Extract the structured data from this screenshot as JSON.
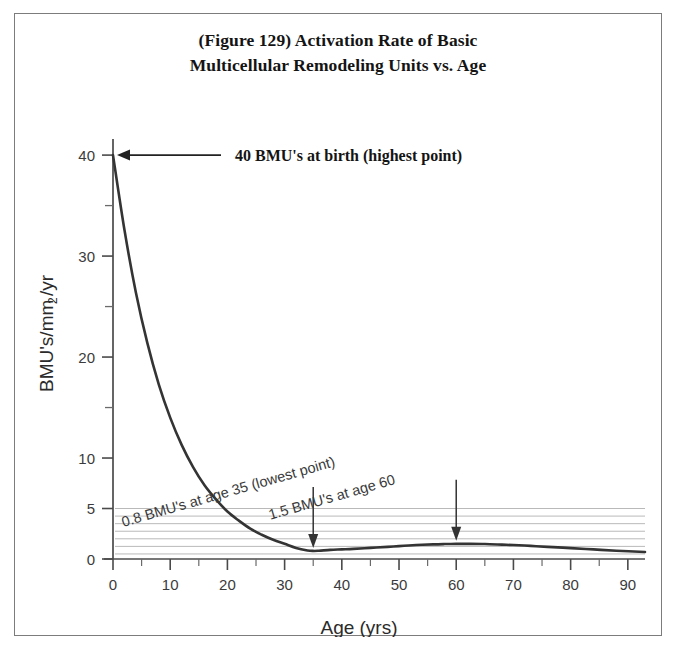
{
  "figure": {
    "title_line1": "(Figure 129) Activation Rate of Basic",
    "title_line2": "Multicellular Remodeling Units vs. Age",
    "border_color": "#7c7c7c",
    "background": "#ffffff"
  },
  "chart_data": {
    "type": "line",
    "title": "(Figure 129) Activation Rate of Basic Multicellular Remodeling Units vs. Age",
    "xlabel": "Age (yrs)",
    "ylabel": "BMU's/mm2/yr",
    "ylabel_base": "BMU's/mm",
    "ylabel_sub": "2",
    "ylabel_tail": "/yr",
    "xlim": [
      0,
      93
    ],
    "ylim": [
      0,
      41
    ],
    "grid": "horizontal gridlines only, between y=0.5 and y=5 at 0.75 steps, spanning full plot width",
    "legend": "none",
    "x_major_ticks": [
      0,
      10,
      20,
      30,
      40,
      50,
      60,
      70,
      80,
      90
    ],
    "x_tick_labels": [
      "0",
      "10",
      "20",
      "30",
      "40",
      "50",
      "60",
      "70",
      "80",
      "90"
    ],
    "x_minor_ticks": [
      5,
      15,
      25,
      35,
      45,
      55,
      65,
      75,
      85
    ],
    "y_major_ticks": [
      0,
      5,
      10,
      20,
      30,
      40
    ],
    "y_tick_labels": [
      "0",
      "5",
      "10",
      "20",
      "30",
      "40"
    ],
    "y_minor_ticks": [
      15,
      25,
      35
    ],
    "gridline_values": [
      0.5,
      1.25,
      2.0,
      2.75,
      3.5,
      4.25,
      5.0
    ],
    "gridline_color": "#b9b9b9",
    "curve_color": "#343434",
    "curve_width": 2.6,
    "x": [
      0,
      2,
      4,
      6,
      8,
      10,
      12,
      14,
      16,
      18,
      20,
      22,
      24,
      26,
      28,
      30,
      32,
      34,
      35,
      36,
      38,
      40,
      42,
      45,
      48,
      50,
      53,
      56,
      58,
      60,
      62,
      65,
      68,
      70,
      73,
      76,
      80,
      84,
      88,
      93
    ],
    "y": [
      40.0,
      32.6,
      26.4,
      21.4,
      17.3,
      14.0,
      11.3,
      9.1,
      7.3,
      5.9,
      4.7,
      3.8,
      3.0,
      2.4,
      1.9,
      1.5,
      1.1,
      0.85,
      0.8,
      0.82,
      0.9,
      0.95,
      1.0,
      1.1,
      1.2,
      1.28,
      1.38,
      1.45,
      1.48,
      1.5,
      1.5,
      1.48,
      1.42,
      1.38,
      1.3,
      1.2,
      1.08,
      0.95,
      0.82,
      0.7
    ],
    "annotations": [
      {
        "name": "peak-annotation",
        "text": "40 BMU's at birth (highest point)",
        "point_x": 0,
        "point_y": 40,
        "arrow": "horizontal-left",
        "style": "serif-bold"
      },
      {
        "name": "min-annotation",
        "text": "0.8 BMU's at age 35 (lowest point)",
        "point_x": 35,
        "point_y": 0.8,
        "arrow": "vertical-down",
        "style": "sans-rotated"
      },
      {
        "name": "rebound-annotation",
        "text": "1.5 BMU's at age 60",
        "point_x": 60,
        "point_y": 1.5,
        "arrow": "vertical-down",
        "style": "sans-rotated"
      }
    ]
  }
}
